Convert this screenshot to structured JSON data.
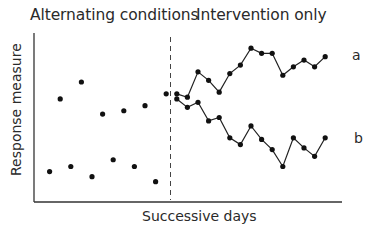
{
  "chart_data": {
    "type": "scatter",
    "title": "",
    "phases": [
      "Alternating conditions",
      "Intervention only"
    ],
    "xlabel": "Successive days",
    "ylabel": "Response measure",
    "xlim": [
      0,
      28
    ],
    "ylim": [
      0,
      100
    ],
    "grid": false,
    "ticks": false,
    "phase_divider": {
      "x": 12.5,
      "style": "dashed"
    },
    "series": [
      {
        "name": "a",
        "phase": "Alternating conditions",
        "style": "points",
        "x": [
          2,
          4,
          6,
          8,
          10,
          12
        ],
        "values": [
          61,
          71,
          52,
          54,
          57,
          64
        ]
      },
      {
        "name": "b",
        "phase": "Alternating conditions",
        "style": "points",
        "x": [
          1,
          3,
          5,
          7,
          9,
          11
        ],
        "values": [
          18,
          21,
          15,
          25,
          21,
          12
        ]
      },
      {
        "name": "a",
        "phase": "Intervention only",
        "style": "line+points",
        "x": [
          13,
          14,
          15,
          16,
          17,
          18,
          19,
          20,
          21,
          22,
          23,
          24,
          25,
          26,
          27
        ],
        "values": [
          64,
          62,
          77,
          72,
          65,
          76,
          81,
          91,
          88,
          88,
          75,
          80,
          84,
          80,
          86
        ]
      },
      {
        "name": "b",
        "phase": "Intervention only",
        "style": "line+points",
        "x": [
          13,
          14,
          15,
          16,
          17,
          18,
          19,
          20,
          21,
          22,
          23,
          24,
          25,
          26,
          27
        ],
        "values": [
          61,
          56,
          59,
          48,
          50,
          38,
          34,
          45,
          37,
          31,
          21,
          38,
          32,
          27,
          38
        ]
      }
    ],
    "series_labels": [
      "a",
      "b"
    ],
    "legend": "inline labels at right end of lines"
  },
  "text": {
    "phase_left": "Alternating conditions",
    "phase_right": "Intervention only",
    "ylabel": "Response measure",
    "xlabel": "Successive days",
    "label_a": "a",
    "label_b": "b"
  }
}
